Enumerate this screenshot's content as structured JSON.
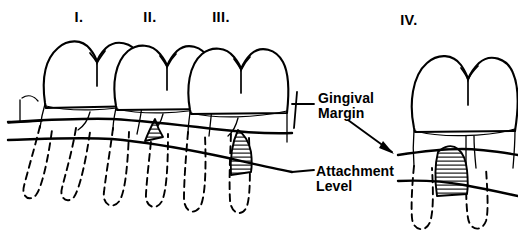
{
  "figure": {
    "background_color": "#ffffff",
    "line_color": "#000000"
  },
  "numerals": [
    {
      "label": "I.",
      "x": 79,
      "y": 22
    },
    {
      "label": "II.",
      "x": 150,
      "y": 22
    },
    {
      "label": "III.",
      "x": 221,
      "y": 22
    },
    {
      "label": "IV.",
      "x": 409,
      "y": 25
    }
  ],
  "labels": {
    "gingival_margin": {
      "line1": "Gingival",
      "line2": "Margin"
    },
    "attachment_level": {
      "line1": "Attachment",
      "line2": "Level"
    }
  },
  "legend_lines": {
    "gingival_margin_name": "Gingival Margin",
    "attachment_level_name": "Attachment Level"
  },
  "teeth": [
    {
      "id": "tooth-1",
      "numeral": "I.",
      "pocket": "none"
    },
    {
      "id": "tooth-2",
      "numeral": "II.",
      "pocket": "small"
    },
    {
      "id": "tooth-3",
      "numeral": "III.",
      "pocket": "large"
    },
    {
      "id": "tooth-4",
      "numeral": "IV.",
      "pocket": "large"
    }
  ]
}
